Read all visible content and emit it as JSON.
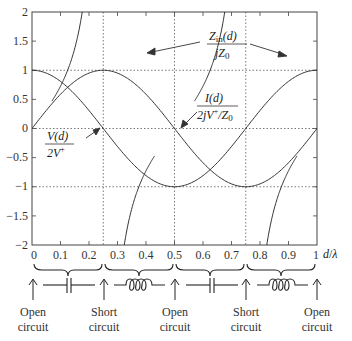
{
  "chart_data": {
    "type": "line",
    "title": "",
    "xlabel": "d/λ",
    "ylabel": "",
    "xlim": [
      0,
      1
    ],
    "ylim": [
      -2,
      2
    ],
    "x_ticks": [
      "0",
      "0.1",
      "0.2",
      "0.3",
      "0.4",
      "0.5",
      "0.6",
      "0.7",
      "0.8",
      "0.9",
      "1"
    ],
    "y_ticks": [
      "2",
      "1.5",
      "1",
      "0.5",
      "0",
      "−0.5",
      "−1",
      "−1.5",
      "−2"
    ],
    "grid": "dotted at y=1, 0, -1 and x=0.25, 0.5, 0.75",
    "series": [
      {
        "name": "V(d)/2V+",
        "formula": "cos(2πd/λ)",
        "x": [
          0,
          0.125,
          0.25,
          0.375,
          0.5,
          0.625,
          0.75,
          0.875,
          1
        ],
        "values": [
          1,
          0.707,
          0,
          -0.707,
          -1,
          -0.707,
          0,
          0.707,
          1
        ]
      },
      {
        "name": "I(d)/(2jV+/Z0)",
        "formula": "sin(2πd/λ)",
        "x": [
          0,
          0.125,
          0.25,
          0.375,
          0.5,
          0.625,
          0.75,
          0.875,
          1
        ],
        "values": [
          0,
          0.707,
          1,
          0.707,
          0,
          -0.707,
          -1,
          -0.707,
          0
        ]
      },
      {
        "name": "Zin(d)/jZ0",
        "formula": "tan(2πd/λ)",
        "x": [
          0.075,
          0.125,
          0.176,
          0.25,
          0.324,
          0.375,
          0.425,
          0.5,
          0.575,
          0.625,
          0.676,
          0.75,
          0.824,
          0.875,
          0.925
        ],
        "values": [
          -2,
          -1,
          -0.5,
          0,
          0.5,
          1,
          2,
          0,
          -2,
          -1,
          -0.5,
          0,
          0.5,
          1,
          2
        ]
      }
    ],
    "annotations": {
      "zin_label_num": "Z",
      "zin_label_sub": "in",
      "zin_label_rest": "(d)",
      "zin_label_den": "jZ",
      "zin_label_den_sub": "0",
      "i_label_num": "I(d)",
      "i_label_den": "2jV",
      "i_label_den_sup": "+",
      "i_label_den_rest": "/Z",
      "i_label_den_sub": "0",
      "v_label_num": "V(d)",
      "v_label_den": "2V",
      "v_label_den_sup": "+",
      "xlabel_d": "d",
      "xlabel_slash": "/",
      "xlabel_lambda": "λ"
    },
    "regions": [
      {
        "range": "0–0.25",
        "element": "capacitor"
      },
      {
        "range": "0.25–0.5",
        "element": "inductor"
      },
      {
        "range": "0.5–0.75",
        "element": "capacitor"
      },
      {
        "range": "0.75–1",
        "element": "inductor"
      }
    ],
    "endpoints": [
      {
        "x": "0",
        "line1": "Open",
        "line2": "circuit"
      },
      {
        "x": "0.25",
        "line1": "Short",
        "line2": "circuit"
      },
      {
        "x": "0.5",
        "line1": "Open",
        "line2": "circuit"
      },
      {
        "x": "0.75",
        "line1": "Short",
        "line2": "circuit"
      },
      {
        "x": "1",
        "line1": "Open",
        "line2": "circuit"
      }
    ]
  }
}
